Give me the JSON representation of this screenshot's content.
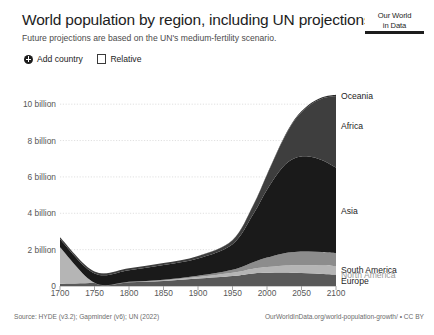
{
  "header": {
    "title": "World population by region, including UN projections",
    "subtitle": "Future projections are based on the UN's medium-fertility scenario."
  },
  "logo": {
    "line1": "Our World",
    "line2": "in Data"
  },
  "controls": {
    "add_country_label": "Add country",
    "add_country_icon": "plus-circle-icon",
    "relative_label": "Relative",
    "relative_checked": false
  },
  "footer": {
    "source": "Source: HYDE (v3.2); Gapminder (v6); UN (2022)",
    "attribution": "OurWorldInData.org/world-population-growth/ • CC BY"
  },
  "chart_data": {
    "type": "area",
    "stacked": true,
    "title": "World population by region, including UN projections",
    "subtitle": "Future projections are based on the UN's medium-fertility scenario.",
    "xlabel": "",
    "ylabel": "",
    "xlim": [
      1700,
      2100
    ],
    "ylim": [
      0,
      11000000000
    ],
    "grid": true,
    "legend_position": "right-inline",
    "x_ticks": [
      1700,
      1750,
      1800,
      1850,
      1900,
      1950,
      2000,
      2050,
      2100
    ],
    "x_tick_labels": [
      "1700",
      "1750",
      "1800",
      "1850",
      "1900",
      "1950",
      "2000",
      "2050",
      "2100"
    ],
    "y_ticks": [
      0,
      2000000000,
      4000000000,
      6000000000,
      8000000000,
      10000000000
    ],
    "y_tick_labels": [
      "0",
      "2 billion",
      "4 billion",
      "6 billion",
      "8 billion",
      "10 billion"
    ],
    "x": [
      1700,
      1750,
      1800,
      1850,
      1900,
      1950,
      1980,
      2000,
      2022,
      2040,
      2060,
      2080,
      2100
    ],
    "series": [
      {
        "name": "Europe",
        "label": "Europe",
        "color": "#595959",
        "label_color": "#1d1d1d",
        "label_y_value": 260000000,
        "values": [
          125000000,
          163000000,
          203000000,
          276000000,
          408000000,
          549000000,
          694000000,
          726000000,
          744000000,
          728000000,
          700000000,
          666000000,
          630000000
        ]
      },
      {
        "name": "North America",
        "label": "North America",
        "color": "#b5b5b5",
        "label_color": "#9a9a9a",
        "label_y_value": 610000000,
        "values": [
          2000000000,
          2000000,
          7000000,
          26000000,
          82000000,
          173000000,
          254000000,
          313000000,
          375000000,
          415000000,
          442000000,
          460000000,
          470000000
        ]
      },
      {
        "name": "South America",
        "label": "South America",
        "color": "#8c8c8c",
        "label_color": "#1d1d1d",
        "label_y_value": 900000000,
        "values": [
          12000000,
          16000000,
          24000000,
          38000000,
          74000000,
          169000000,
          362000000,
          522000000,
          660000000,
          730000000,
          752000000,
          740000000,
          700000000
        ]
      },
      {
        "name": "Asia",
        "label": "Asia",
        "color": "#1a1a1a",
        "label_color": "#1d1d1d",
        "label_y_value": 4100000000,
        "values": [
          436000000,
          508000000,
          635000000,
          809000000,
          947000000,
          1404000000,
          2642000000,
          3736000000,
          4722000000,
          5154000000,
          5232000000,
          5055000000,
          4720000000
        ]
      },
      {
        "name": "Africa",
        "label": "Africa",
        "color": "#3e3e3e",
        "label_color": "#1d1d1d",
        "label_y_value": 8800000000,
        "values": [
          106000000,
          106000000,
          107000000,
          111000000,
          138000000,
          228000000,
          481000000,
          818000000,
          1427000000,
          2092000000,
          2766000000,
          3391000000,
          3924000000
        ]
      },
      {
        "name": "Oceania",
        "label": "Oceania",
        "color": "#2b2b2b",
        "label_color": "#1d1d1d",
        "label_y_value": 10450000000,
        "values": [
          3000000,
          3000000,
          2000000,
          2000000,
          6000000,
          13000000,
          23000000,
          31000000,
          45000000,
          53000000,
          60000000,
          66000000,
          70000000
        ]
      }
    ],
    "totals": [
      684000000,
      795000000,
      978000000,
      1262000000,
      1655000000,
      2536000000,
      4456000000,
      6146000000,
      7973000000,
      9172000000,
      9952000000,
      10378000000,
      10514000000
    ]
  }
}
